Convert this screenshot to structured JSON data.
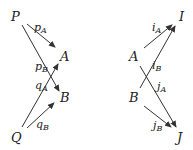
{
  "left_diagram": {
    "nodes": {
      "P": {
        "label": "P"
      },
      "Q": {
        "label": "Q"
      },
      "A": {
        "label": "A"
      },
      "B": {
        "label": "B"
      }
    },
    "edges": [
      {
        "id": "pA",
        "from": "P",
        "to": "A",
        "base": "p",
        "sub": "A"
      },
      {
        "id": "pB",
        "from": "P",
        "to": "B",
        "base": "p",
        "sub": "B"
      },
      {
        "id": "qA",
        "from": "Q",
        "to": "A",
        "base": "q",
        "sub": "A"
      },
      {
        "id": "qB",
        "from": "Q",
        "to": "B",
        "base": "q",
        "sub": "B"
      }
    ]
  },
  "right_diagram": {
    "nodes": {
      "A": {
        "label": "A"
      },
      "B": {
        "label": "B"
      },
      "I": {
        "label": "I"
      },
      "J": {
        "label": "J"
      }
    },
    "edges": [
      {
        "id": "iA",
        "from": "A",
        "to": "I",
        "base": "i",
        "sub": "A"
      },
      {
        "id": "iB",
        "from": "B",
        "to": "I",
        "base": "i",
        "sub": "B"
      },
      {
        "id": "jA",
        "from": "A",
        "to": "J",
        "base": "j",
        "sub": "A"
      },
      {
        "id": "jB",
        "from": "B",
        "to": "J",
        "base": "j",
        "sub": "B"
      }
    ]
  },
  "colors": {
    "ink": "#333333",
    "background": "#ffffff"
  }
}
